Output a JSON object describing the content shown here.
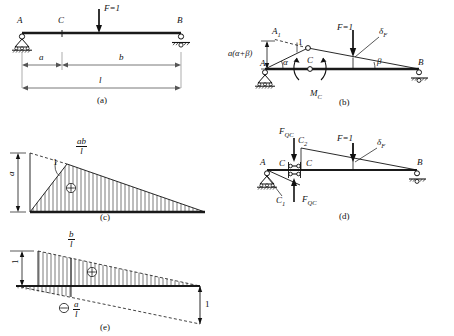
{
  "figure": {
    "panels": [
      {
        "id": "a",
        "caption": "(a)",
        "desc": "Simply supported beam AB with unit load F=1 at section and dimensions a, b, l"
      },
      {
        "id": "b",
        "caption": "(b)",
        "desc": "Virtual displacement diagram for bending moment M_C at C"
      },
      {
        "id": "c",
        "caption": "(c)",
        "desc": "Influence line for M_C, ordinate ab/l"
      },
      {
        "id": "d",
        "caption": "(d)",
        "desc": "Virtual displacement diagram for shear force F_QC at C"
      },
      {
        "id": "e",
        "caption": "(e)",
        "desc": "Influence line for F_QC, ordinates b/l and a/l"
      }
    ]
  },
  "panel_a": {
    "caption": "(a)",
    "node_A": "A",
    "node_B": "B",
    "node_C": "C",
    "load": "F=1",
    "dim_a": "a",
    "dim_b": "b",
    "dim_l": "l",
    "support_left": "pin-support",
    "support_right": "roller-support"
  },
  "panel_b": {
    "caption": "(b)",
    "node_A": "A",
    "node_A1": "A",
    "node_A1_sub": "1",
    "node_B": "B",
    "node_C": "C",
    "load": "F=1",
    "rotation_label": "a(α+β)",
    "angle_alpha": "α",
    "angle_beta": "β",
    "unit_rise": "1",
    "moment": "M",
    "moment_sub": "C",
    "deflection": "δ",
    "deflection_sub": "F"
  },
  "panel_c": {
    "caption": "(c)",
    "ordinate_left": "a",
    "peak_num": "ab",
    "peak_den": "l",
    "slope_unit": "1",
    "sign": "⊕",
    "sign_name": "positive-sign"
  },
  "panel_d": {
    "caption": "(d)",
    "node_A": "A",
    "node_B": "B",
    "node_C_left": "C",
    "node_C_right": "C",
    "node_C1": "C",
    "node_C1_sub": "1",
    "node_C2": "C",
    "node_C2_sub": "2",
    "load": "F=1",
    "shear_top": "F",
    "shear_top_sub": "QC",
    "shear_bottom": "F",
    "shear_bottom_sub": "QC",
    "deflection": "δ",
    "deflection_sub": "F"
  },
  "panel_e": {
    "caption": "(e)",
    "ordinate_left": "1",
    "ordinate_right": "1",
    "pos_num": "b",
    "pos_den": "l",
    "neg_num": "a",
    "neg_den": "l",
    "sign_pos": "⊕",
    "sign_neg": "⊖"
  },
  "colors": {
    "ink": "#111111",
    "beam": "#1a1a1a",
    "hatch": "#333333",
    "dim": "#555555",
    "background": "#ffffff"
  }
}
